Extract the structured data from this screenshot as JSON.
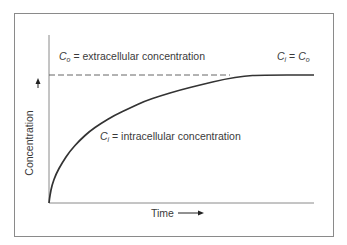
{
  "chart_data": {
    "type": "line",
    "title": "",
    "xlabel": "Time",
    "ylabel": "Concentration",
    "xlabel_arrow": "→",
    "ylabel_arrow": "→",
    "series": [
      {
        "name": "C_i = intracellular concentration",
        "style": "solid",
        "points_px": [
          [
            49,
            203
          ],
          [
            50,
            195
          ],
          [
            52,
            185
          ],
          [
            56,
            174
          ],
          [
            62,
            163
          ],
          [
            70,
            151
          ],
          [
            80,
            140
          ],
          [
            90,
            131
          ],
          [
            100,
            124
          ],
          [
            115,
            115
          ],
          [
            130,
            108
          ],
          [
            145,
            101
          ],
          [
            160,
            96
          ],
          [
            180,
            90
          ],
          [
            200,
            85
          ],
          [
            225,
            79
          ],
          [
            245,
            76
          ],
          [
            260,
            75
          ],
          [
            314,
            75
          ]
        ]
      },
      {
        "name": "C_o = extracellular concentration",
        "style": "dashed",
        "points_px": [
          [
            49,
            75
          ],
          [
            230,
            75
          ]
        ]
      }
    ],
    "annotations": [
      {
        "text": "C_o = extracellular concentration"
      },
      {
        "text": "C_i = intracellular concentration"
      },
      {
        "text": "C_i = C_o"
      }
    ],
    "grid": false,
    "legend": "none"
  },
  "labels": {
    "co_sym": "C",
    "co_sub": "o",
    "co_text": " = extracellular concentration",
    "ci_sym": "C",
    "ci_sub": "i",
    "ci_text": " = intracellular concentration",
    "eq_left_sym": "C",
    "eq_left_sub": "i",
    "eq_mid": " = ",
    "eq_right_sym": "C",
    "eq_right_sub": "o",
    "xlabel": "Time",
    "ylabel": "Concentration"
  }
}
